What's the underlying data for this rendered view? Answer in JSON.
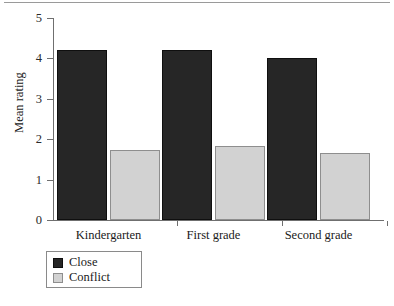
{
  "chart_data": {
    "type": "bar",
    "title": "",
    "subtitle": "",
    "xlabel": "",
    "ylabel": "Mean rating",
    "categories": [
      "Kindergarten",
      "First grade",
      "Second grade"
    ],
    "series": [
      {
        "name": "Close",
        "values": [
          4.22,
          4.21,
          4.02
        ],
        "color": "#262626"
      },
      {
        "name": "Conflict",
        "values": [
          1.74,
          1.83,
          1.66
        ],
        "color": "#d2d2d2"
      }
    ],
    "ylim": [
      0,
      5
    ],
    "yticks": [
      0,
      1,
      2,
      3,
      4,
      5
    ],
    "ytick_labels": [
      "0",
      "1",
      "2",
      "3",
      "4",
      "5"
    ],
    "grid": false,
    "legend_position": "bottom-left",
    "legend_entries": [
      "Close",
      "Conflict"
    ]
  },
  "figure": {
    "top_rule": true,
    "background": "#ffffff",
    "axis_color": "#6f6f6f",
    "text_color": "#1a1a1a"
  }
}
